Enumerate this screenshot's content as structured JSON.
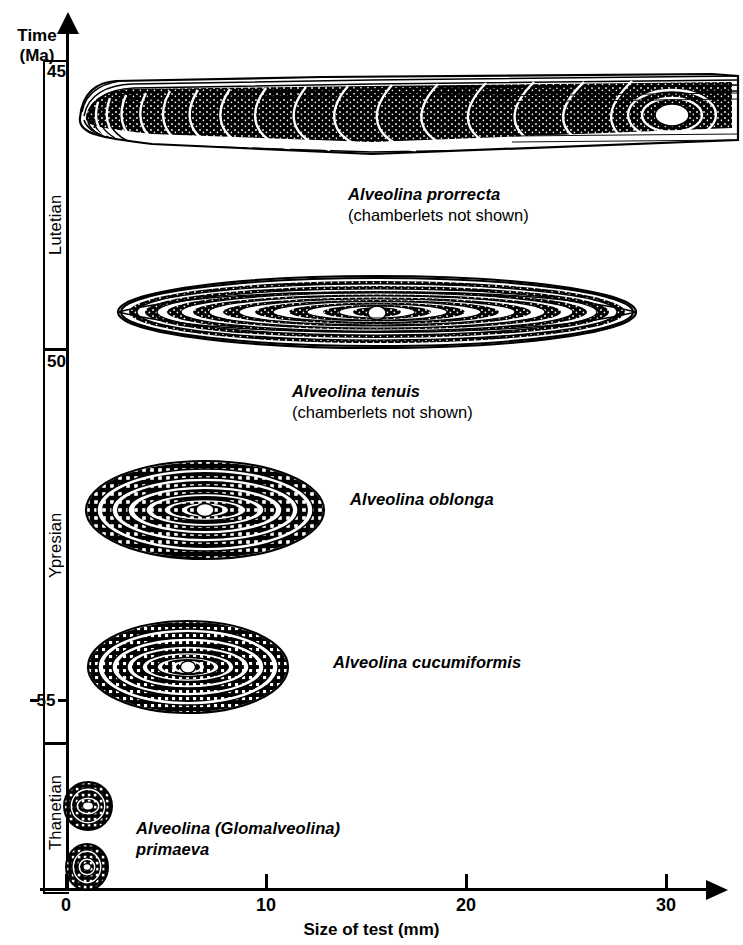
{
  "figure": {
    "kind": "scientific-line-drawing-chart"
  },
  "yaxis": {
    "title_line1": "Time",
    "title_line2": "(Ma)",
    "ticks": [
      {
        "label": "45",
        "value": 45
      },
      {
        "label": "50",
        "value": 50
      },
      {
        "label": "55",
        "value": 55
      }
    ],
    "stages": [
      {
        "name": "Lutetian"
      },
      {
        "name": "Ypresian"
      },
      {
        "name": "Thanetian"
      }
    ]
  },
  "xaxis": {
    "title": "Size of test (mm)",
    "ticks": [
      {
        "label": "0",
        "value": 0
      },
      {
        "label": "10",
        "value": 10
      },
      {
        "label": "20",
        "value": 20
      },
      {
        "label": "30",
        "value": 30
      }
    ]
  },
  "specimens": [
    {
      "genus_species": "Alveolina prorrecta",
      "note": "(chamberlets not shown)",
      "stage": "Lutetian",
      "size_mm": 32,
      "shape": "elongate-spindle"
    },
    {
      "genus_species": "Alveolina tenuis",
      "note": "(chamberlets not shown)",
      "stage": "Lutetian",
      "size_mm": 29,
      "shape": "elongate-fusiform"
    },
    {
      "genus_species": "Alveolina oblonga",
      "note": "",
      "stage": "Ypresian",
      "size_mm": 11,
      "shape": "oblong-ellipsoid"
    },
    {
      "genus_species": "Alveolina cucumiformis",
      "note": "",
      "stage": "Ypresian",
      "size_mm": 9,
      "shape": "cucumber-ellipsoid"
    },
    {
      "genus_species": "Alveolina (Glomalveolina) primaeva",
      "note": "",
      "stage": "Thanetian",
      "size_mm": 2,
      "shape": "globular"
    }
  ],
  "chart_data": {
    "type": "scatter",
    "title": "",
    "xlabel": "Size of test (mm)",
    "ylabel": "Time (Ma)",
    "xlim": [
      0,
      33
    ],
    "ylim": [
      56.5,
      44.5
    ],
    "xticks": [
      0,
      10,
      20,
      30
    ],
    "yticks": [
      45,
      50,
      55
    ],
    "grid": false,
    "legend": "none",
    "categories": [
      "Alveolina prorrecta",
      "Alveolina tenuis",
      "Alveolina oblonga",
      "Alveolina cucumiformis",
      "Alveolina (Glomalveolina) primaeva"
    ],
    "points": [
      {
        "label": "Alveolina prorrecta",
        "x": 32,
        "y": 45.5,
        "annotation": "(chamberlets not shown)"
      },
      {
        "label": "Alveolina tenuis",
        "x": 29,
        "y": 47.8,
        "annotation": "(chamberlets not shown)"
      },
      {
        "label": "Alveolina oblonga",
        "x": 11,
        "y": 51.1,
        "annotation": ""
      },
      {
        "label": "Alveolina cucumiformis",
        "x": 9,
        "y": 53.5,
        "annotation": ""
      },
      {
        "label": "Alveolina (Glomalveolina) primaeva",
        "x": 2,
        "y": 55.8,
        "annotation": ""
      }
    ],
    "bands": [
      {
        "name": "Lutetian",
        "from": 44.5,
        "to": 50.0
      },
      {
        "name": "Ypresian",
        "from": 50.0,
        "to": 54.8
      },
      {
        "name": "Thanetian",
        "from": 54.8,
        "to": 56.5
      }
    ]
  },
  "colors": {
    "ink": "#000000",
    "background": "#ffffff"
  }
}
